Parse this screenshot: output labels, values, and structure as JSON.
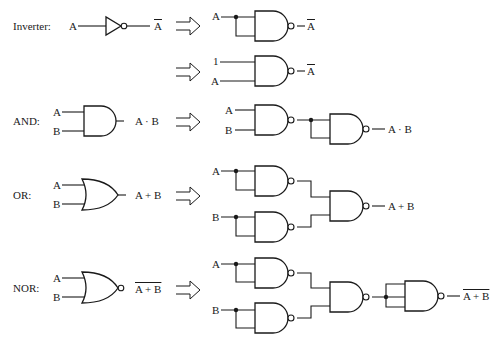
{
  "diagram": {
    "rows": [
      {
        "name": "Inverter",
        "label": "Inverter:",
        "original": {
          "gate": "NOT",
          "inputs": [
            "A"
          ],
          "output": "A",
          "output_overline": true
        },
        "nand_equivalents": [
          {
            "description": "NAND with both inputs tied to A",
            "inputs": [
              "A"
            ],
            "output": "A",
            "output_overline": true
          },
          {
            "description": "NAND with inputs 1 and A",
            "inputs": [
              "1",
              "A"
            ],
            "output": "A",
            "output_overline": true
          }
        ]
      },
      {
        "name": "AND",
        "label": "AND:",
        "original": {
          "gate": "AND",
          "inputs": [
            "A",
            "B"
          ],
          "output": "A · B"
        },
        "nand_equivalent": {
          "inputs": [
            "A",
            "B"
          ],
          "output": "A · B",
          "gates": 2
        }
      },
      {
        "name": "OR",
        "label": "OR:",
        "original": {
          "gate": "OR",
          "inputs": [
            "A",
            "B"
          ],
          "output": "A + B"
        },
        "nand_equivalent": {
          "inputs": [
            "A",
            "B"
          ],
          "output": "A + B",
          "gates": 3
        }
      },
      {
        "name": "NOR",
        "label": "NOR:",
        "original": {
          "gate": "NOR",
          "inputs": [
            "A",
            "B"
          ],
          "output": "A + B",
          "output_overline": true
        },
        "nand_equivalent": {
          "inputs": [
            "A",
            "B"
          ],
          "output": "A + B",
          "output_overline": true,
          "gates": 4
        }
      }
    ]
  },
  "labels": {
    "inverter": "Inverter:",
    "and": "AND:",
    "or": "OR:",
    "nor": "NOR:",
    "A": "A",
    "B": "B",
    "one": "1",
    "not_a": "A",
    "a_and_b": "A · B",
    "a_or_b": "A + B",
    "a_nor_b": "A + B"
  },
  "colors": {
    "stroke": "#1a1a1a",
    "background": "#ffffff"
  }
}
